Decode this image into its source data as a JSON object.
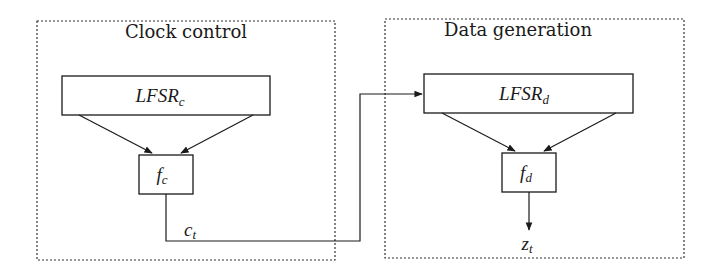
{
  "diagram": {
    "groups": [
      {
        "id": "clock-control",
        "title": "Clock control"
      },
      {
        "id": "data-generation",
        "title": "Data generation"
      }
    ],
    "nodes": {
      "lfsr_c": {
        "base": "LFSR",
        "sub": "c"
      },
      "f_c": {
        "base": "f",
        "sub": "c"
      },
      "lfsr_d": {
        "base": "LFSR",
        "sub": "d"
      },
      "f_d": {
        "base": "f",
        "sub": "d"
      }
    },
    "signals": {
      "c_t": {
        "base": "c",
        "sub": "t"
      },
      "z_t": {
        "base": "z",
        "sub": "t"
      }
    },
    "edges": [
      {
        "from": "lfsr_c",
        "to": "f_c",
        "count": 2
      },
      {
        "from": "f_c",
        "to": "lfsr_d",
        "label": "c_t"
      },
      {
        "from": "lfsr_d",
        "to": "f_d",
        "count": 2
      },
      {
        "from": "f_d",
        "to": "output",
        "label": "z_t"
      }
    ]
  },
  "colors": {
    "stroke": "#1a1a1a",
    "dashed": "#333333",
    "background": "#ffffff"
  }
}
